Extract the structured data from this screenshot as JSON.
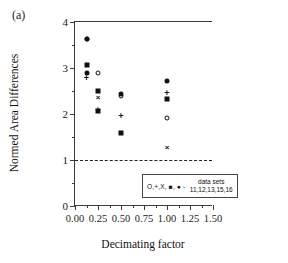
{
  "panel_label": "(a)",
  "chart_data": {
    "type": "scatter",
    "title": "",
    "xlabel": "Decimating factor",
    "ylabel": "Normed Area Differences",
    "xlim": [
      0.0,
      1.5
    ],
    "ylim": [
      0,
      4
    ],
    "xticks": [
      "0.00",
      "0.25",
      "0.50",
      "0.75",
      "1.00",
      "1.25",
      "1.50"
    ],
    "xtick_values": [
      0.0,
      0.25,
      0.5,
      0.75,
      1.0,
      1.25,
      1.5
    ],
    "xminor_values": [
      0.125,
      0.375,
      0.625,
      0.875,
      1.125,
      1.375
    ],
    "yticks": [
      "0",
      "1",
      "2",
      "3",
      "4"
    ],
    "ytick_values": [
      0,
      1,
      2,
      3,
      4
    ],
    "yminor_values": [
      0.5,
      1.5,
      2.5,
      3.5
    ],
    "grid": false,
    "legend_position": "lower-right",
    "reference_line": {
      "y": 1.0,
      "style": "dashed"
    },
    "x": [
      0.125,
      0.25,
      0.5,
      1.0
    ],
    "series": [
      {
        "name": "11",
        "marker": "circle-open",
        "values": [
          3.64,
          2.9,
          2.42,
          1.92
        ]
      },
      {
        "name": "12",
        "marker": "plus",
        "values": [
          2.78,
          2.09,
          1.95,
          2.45
        ]
      },
      {
        "name": "13",
        "marker": "ex",
        "values": [
          null,
          2.36,
          null,
          1.28
        ]
      },
      {
        "name": "15",
        "marker": "square-filled",
        "values": [
          3.07,
          2.5,
          1.59,
          2.32
        ]
      },
      {
        "name": "16",
        "marker": "circle-filled",
        "values": [
          2.89,
          2.07,
          2.44,
          2.72
        ]
      }
    ],
    "points": [
      {
        "x": 0.125,
        "y": 3.64,
        "marker": "circle-open",
        "series": "11"
      },
      {
        "x": 0.125,
        "y": 3.62,
        "marker": "circle-filled",
        "series": "16"
      },
      {
        "x": 0.125,
        "y": 3.07,
        "marker": "square-filled",
        "series": "15"
      },
      {
        "x": 0.125,
        "y": 2.89,
        "marker": "circle-filled",
        "series": "16"
      },
      {
        "x": 0.125,
        "y": 2.78,
        "marker": "plus",
        "series": "12"
      },
      {
        "x": 0.25,
        "y": 2.9,
        "marker": "circle-open",
        "series": "11"
      },
      {
        "x": 0.25,
        "y": 2.5,
        "marker": "square-filled",
        "series": "15"
      },
      {
        "x": 0.25,
        "y": 2.36,
        "marker": "ex",
        "series": "13"
      },
      {
        "x": 0.25,
        "y": 2.09,
        "marker": "plus",
        "series": "12"
      },
      {
        "x": 0.25,
        "y": 2.07,
        "marker": "square-filled",
        "series": "15"
      },
      {
        "x": 0.5,
        "y": 2.44,
        "marker": "circle-filled",
        "series": "16"
      },
      {
        "x": 0.5,
        "y": 2.4,
        "marker": "circle-open",
        "series": "11"
      },
      {
        "x": 0.5,
        "y": 1.95,
        "marker": "plus",
        "series": "12"
      },
      {
        "x": 0.5,
        "y": 1.59,
        "marker": "square-filled",
        "series": "15"
      },
      {
        "x": 1.0,
        "y": 2.72,
        "marker": "circle-filled",
        "series": "16"
      },
      {
        "x": 1.0,
        "y": 2.45,
        "marker": "plus",
        "series": "12"
      },
      {
        "x": 1.0,
        "y": 2.32,
        "marker": "square-filled",
        "series": "15"
      },
      {
        "x": 1.0,
        "y": 1.92,
        "marker": "circle-open",
        "series": "11"
      },
      {
        "x": 1.0,
        "y": 1.28,
        "marker": "ex",
        "series": "13"
      }
    ]
  },
  "legend": {
    "symbols": "O,+,X, ■, ● -",
    "line1": "data sets",
    "line2": "11,12,13,15,16"
  }
}
